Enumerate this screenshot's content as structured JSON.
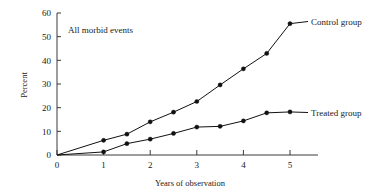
{
  "chart_data": {
    "type": "line",
    "title": "",
    "annotation": "All morbid events",
    "xlabel": "Years of observation",
    "ylabel": "Percent",
    "xlim": [
      0,
      5.6
    ],
    "ylim": [
      0,
      60
    ],
    "xticks": [
      0,
      1,
      2,
      3,
      4,
      5
    ],
    "xtick_labels": [
      "0",
      "1",
      "2",
      "3",
      "4",
      "5"
    ],
    "yticks": [
      0,
      10,
      20,
      30,
      40,
      50,
      60
    ],
    "ytick_labels": [
      "0",
      "10",
      "20",
      "30",
      "40",
      "50",
      "60"
    ],
    "grid": false,
    "legend_position": "right-inline",
    "series": [
      {
        "name": "Control group",
        "label": "Control group",
        "color": "#111111",
        "marker": "filled-circle",
        "x": [
          0,
          1,
          1.5,
          2,
          2.5,
          3,
          3.5,
          4,
          4.5,
          5
        ],
        "values": [
          0,
          6.2,
          8.8,
          14.0,
          18.1,
          22.6,
          29.6,
          36.4,
          42.9,
          55.5
        ]
      },
      {
        "name": "Treated group",
        "label": "Treated group",
        "color": "#111111",
        "marker": "filled-circle",
        "x": [
          0,
          1,
          1.5,
          2,
          2.5,
          3,
          3.5,
          4,
          4.5,
          5
        ],
        "values": [
          0,
          1.3,
          4.8,
          6.7,
          9.1,
          11.8,
          12.1,
          14.4,
          17.8,
          18.2
        ]
      }
    ]
  },
  "figure": {
    "axis_color": "#3a3a3a",
    "background": "#ffffff"
  }
}
